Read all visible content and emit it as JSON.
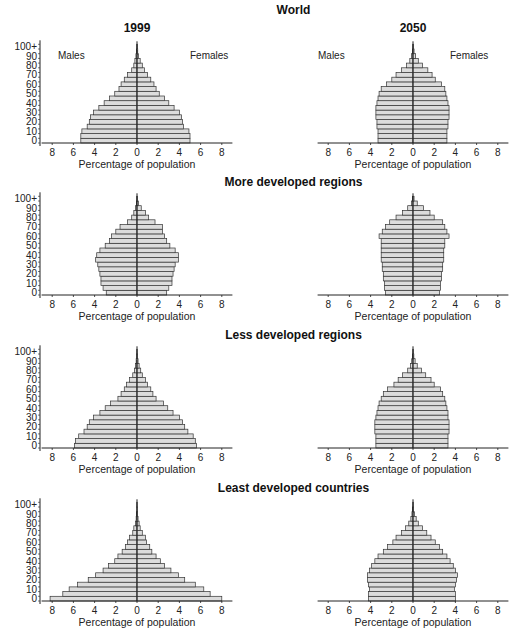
{
  "years": [
    "1999",
    "2050"
  ],
  "sex_labels": {
    "male": "Males",
    "female": "Females"
  },
  "x_axis_label": "Percentage of population",
  "x_ticks": [
    "8",
    "6",
    "4",
    "2",
    "0",
    "2",
    "4",
    "6",
    "8"
  ],
  "y_ticks": [
    "0",
    "10",
    "20",
    "30",
    "40",
    "50",
    "60",
    "70",
    "80",
    "90",
    "100+"
  ],
  "colors": {
    "bar_fill": "#dcdcdc",
    "bar_stroke": "#333333",
    "axis": "#222222"
  },
  "chart_data": [
    {
      "type": "bar",
      "orientation": "horizontal-pyramid",
      "title": "World",
      "year": "1999",
      "categories": [
        "0-4",
        "5-9",
        "10-14",
        "15-19",
        "20-24",
        "25-29",
        "30-34",
        "35-39",
        "40-44",
        "45-49",
        "50-54",
        "55-59",
        "60-64",
        "65-69",
        "70-74",
        "75-79",
        "80-84",
        "85-89",
        "90-94",
        "95-99",
        "100+"
      ],
      "series": [
        {
          "name": "Males",
          "values": [
            5.3,
            5.3,
            5.2,
            4.7,
            4.5,
            4.4,
            4.1,
            3.6,
            3.1,
            2.6,
            2.1,
            1.7,
            1.5,
            1.2,
            0.9,
            0.5,
            0.3,
            0.2,
            0.1,
            0.05,
            0.02
          ]
        },
        {
          "name": "Females",
          "values": [
            5.0,
            5.0,
            4.9,
            4.4,
            4.3,
            4.2,
            4.0,
            3.5,
            3.0,
            2.6,
            2.1,
            1.8,
            1.6,
            1.3,
            1.0,
            0.7,
            0.5,
            0.3,
            0.15,
            0.07,
            0.03
          ]
        }
      ],
      "xlabel": "Percentage of population",
      "ylabel": "Age",
      "xlim": [
        -8,
        8
      ]
    },
    {
      "type": "bar",
      "orientation": "horizontal-pyramid",
      "title": "World",
      "year": "2050",
      "categories": [
        "0-4",
        "5-9",
        "10-14",
        "15-19",
        "20-24",
        "25-29",
        "30-34",
        "35-39",
        "40-44",
        "45-49",
        "50-54",
        "55-59",
        "60-64",
        "65-69",
        "70-74",
        "75-79",
        "80-84",
        "85-89",
        "90-94",
        "95-99",
        "100+"
      ],
      "series": [
        {
          "name": "Males",
          "values": [
            3.3,
            3.3,
            3.3,
            3.4,
            3.4,
            3.5,
            3.5,
            3.5,
            3.4,
            3.3,
            3.2,
            3.0,
            2.5,
            2.0,
            1.6,
            1.1,
            0.6,
            0.3,
            0.15,
            0.05,
            0.02
          ]
        },
        {
          "name": "Females",
          "values": [
            3.2,
            3.2,
            3.2,
            3.3,
            3.3,
            3.4,
            3.4,
            3.4,
            3.3,
            3.2,
            3.1,
            3.0,
            2.7,
            2.1,
            1.8,
            1.4,
            0.9,
            0.5,
            0.25,
            0.1,
            0.04
          ]
        }
      ],
      "xlabel": "Percentage of population",
      "ylabel": "Age",
      "xlim": [
        -8,
        8
      ]
    },
    {
      "type": "bar",
      "orientation": "horizontal-pyramid",
      "title": "More developed regions",
      "year": "1999",
      "categories": [
        "0-4",
        "5-9",
        "10-14",
        "15-19",
        "20-24",
        "25-29",
        "30-34",
        "35-39",
        "40-44",
        "45-49",
        "50-54",
        "55-59",
        "60-64",
        "65-69",
        "70-74",
        "75-79",
        "80-84",
        "85-89",
        "90-94",
        "95-99",
        "100+"
      ],
      "series": [
        {
          "name": "Males",
          "values": [
            2.9,
            3.2,
            3.4,
            3.4,
            3.5,
            3.6,
            3.7,
            3.9,
            3.8,
            3.5,
            3.0,
            2.6,
            2.4,
            2.0,
            1.6,
            0.9,
            0.5,
            0.3,
            0.15,
            0.05,
            0.02
          ]
        },
        {
          "name": "Females",
          "values": [
            2.8,
            3.0,
            3.3,
            3.3,
            3.4,
            3.5,
            3.6,
            3.9,
            3.9,
            3.6,
            3.1,
            2.8,
            2.6,
            2.4,
            2.4,
            1.7,
            1.1,
            0.8,
            0.4,
            0.15,
            0.05
          ]
        }
      ],
      "xlabel": "Percentage of population",
      "ylabel": "Age",
      "xlim": [
        -8,
        8
      ]
    },
    {
      "type": "bar",
      "orientation": "horizontal-pyramid",
      "title": "More developed regions",
      "year": "2050",
      "categories": [
        "0-4",
        "5-9",
        "10-14",
        "15-19",
        "20-24",
        "25-29",
        "30-34",
        "35-39",
        "40-44",
        "45-49",
        "50-54",
        "55-59",
        "60-64",
        "65-69",
        "70-74",
        "75-79",
        "80-84",
        "85-89",
        "90-94",
        "95-99",
        "100+"
      ],
      "series": [
        {
          "name": "Males",
          "values": [
            2.6,
            2.7,
            2.7,
            2.8,
            2.8,
            2.9,
            2.9,
            3.0,
            3.0,
            3.0,
            3.0,
            3.0,
            3.2,
            2.9,
            2.6,
            2.2,
            1.6,
            1.0,
            0.5,
            0.15,
            0.05
          ]
        },
        {
          "name": "Females",
          "values": [
            2.5,
            2.6,
            2.6,
            2.7,
            2.7,
            2.8,
            2.8,
            2.9,
            2.9,
            2.9,
            3.0,
            3.0,
            3.4,
            3.2,
            3.0,
            2.8,
            2.0,
            1.6,
            1.0,
            0.4,
            0.1
          ]
        }
      ],
      "xlabel": "Percentage of population",
      "ylabel": "Age",
      "xlim": [
        -8,
        8
      ]
    },
    {
      "type": "bar",
      "orientation": "horizontal-pyramid",
      "title": "Less developed regions",
      "year": "1999",
      "categories": [
        "0-4",
        "5-9",
        "10-14",
        "15-19",
        "20-24",
        "25-29",
        "30-34",
        "35-39",
        "40-44",
        "45-49",
        "50-54",
        "55-59",
        "60-64",
        "65-69",
        "70-74",
        "75-79",
        "80-84",
        "85-89",
        "90-94",
        "95-99",
        "100+"
      ],
      "series": [
        {
          "name": "Males",
          "values": [
            5.9,
            5.8,
            5.5,
            5.0,
            4.7,
            4.5,
            4.1,
            3.5,
            3.0,
            2.5,
            1.8,
            1.5,
            1.2,
            1.0,
            0.7,
            0.4,
            0.25,
            0.15,
            0.08,
            0.03,
            0.01
          ]
        },
        {
          "name": "Females",
          "values": [
            5.6,
            5.5,
            5.3,
            4.8,
            4.5,
            4.3,
            4.0,
            3.4,
            2.9,
            2.5,
            1.8,
            1.5,
            1.3,
            1.0,
            0.8,
            0.5,
            0.35,
            0.2,
            0.1,
            0.04,
            0.01
          ]
        }
      ],
      "xlabel": "Percentage of population",
      "ylabel": "Age",
      "xlim": [
        -8,
        8
      ]
    },
    {
      "type": "bar",
      "orientation": "horizontal-pyramid",
      "title": "Less developed regions",
      "year": "2050",
      "categories": [
        "0-4",
        "5-9",
        "10-14",
        "15-19",
        "20-24",
        "25-29",
        "30-34",
        "35-39",
        "40-44",
        "45-49",
        "50-54",
        "55-59",
        "60-64",
        "65-69",
        "70-74",
        "75-79",
        "80-84",
        "85-89",
        "90-94",
        "95-99",
        "100+"
      ],
      "series": [
        {
          "name": "Males",
          "values": [
            3.5,
            3.5,
            3.5,
            3.6,
            3.6,
            3.6,
            3.5,
            3.4,
            3.3,
            3.2,
            3.0,
            2.8,
            2.4,
            1.8,
            1.4,
            1.0,
            0.5,
            0.25,
            0.12,
            0.04,
            0.01
          ]
        },
        {
          "name": "Females",
          "values": [
            3.3,
            3.3,
            3.3,
            3.4,
            3.4,
            3.4,
            3.3,
            3.3,
            3.2,
            3.1,
            3.0,
            2.8,
            2.6,
            2.0,
            1.7,
            1.2,
            0.8,
            0.4,
            0.2,
            0.08,
            0.02
          ]
        }
      ],
      "xlabel": "Percentage of population",
      "ylabel": "Age",
      "xlim": [
        -8,
        8
      ]
    },
    {
      "type": "bar",
      "orientation": "horizontal-pyramid",
      "title": "Least developed countries",
      "year": "1999",
      "categories": [
        "0-4",
        "5-9",
        "10-14",
        "15-19",
        "20-24",
        "25-29",
        "30-34",
        "35-39",
        "40-44",
        "45-49",
        "50-54",
        "55-59",
        "60-64",
        "65-69",
        "70-74",
        "75-79",
        "80-84",
        "85-89",
        "90-94",
        "95-99",
        "100+"
      ],
      "series": [
        {
          "name": "Males",
          "values": [
            8.2,
            7.0,
            6.4,
            5.6,
            4.6,
            3.9,
            3.2,
            2.7,
            2.1,
            1.8,
            1.4,
            1.1,
            0.9,
            0.7,
            0.4,
            0.3,
            0.15,
            0.08,
            0.04,
            0.01,
            0.01
          ]
        },
        {
          "name": "Females",
          "values": [
            8.0,
            6.9,
            6.3,
            5.5,
            4.5,
            3.9,
            3.2,
            2.6,
            2.2,
            1.8,
            1.4,
            1.2,
            0.9,
            0.8,
            0.5,
            0.3,
            0.2,
            0.1,
            0.05,
            0.02,
            0.01
          ]
        }
      ],
      "xlabel": "Percentage of population",
      "ylabel": "Age",
      "xlim": [
        -8,
        8
      ]
    },
    {
      "type": "bar",
      "orientation": "horizontal-pyramid",
      "title": "Least developed countries",
      "year": "2050",
      "categories": [
        "0-4",
        "5-9",
        "10-14",
        "15-19",
        "20-24",
        "25-29",
        "30-34",
        "35-39",
        "40-44",
        "45-49",
        "50-54",
        "55-59",
        "60-64",
        "65-69",
        "70-74",
        "75-79",
        "80-84",
        "85-89",
        "90-94",
        "95-99",
        "100+"
      ],
      "series": [
        {
          "name": "Males",
          "values": [
            4.2,
            4.2,
            4.1,
            4.2,
            4.3,
            4.3,
            4.1,
            3.9,
            3.6,
            3.3,
            2.8,
            2.4,
            1.9,
            1.6,
            1.1,
            0.7,
            0.4,
            0.2,
            0.1,
            0.04,
            0.01
          ]
        },
        {
          "name": "Females",
          "values": [
            4.0,
            4.0,
            3.9,
            4.0,
            4.1,
            4.2,
            4.0,
            3.8,
            3.5,
            3.2,
            2.8,
            2.5,
            2.1,
            1.7,
            1.3,
            0.9,
            0.5,
            0.3,
            0.15,
            0.06,
            0.02
          ]
        }
      ],
      "xlabel": "Percentage of population",
      "ylabel": "Age",
      "xlim": [
        -8,
        8
      ]
    }
  ]
}
